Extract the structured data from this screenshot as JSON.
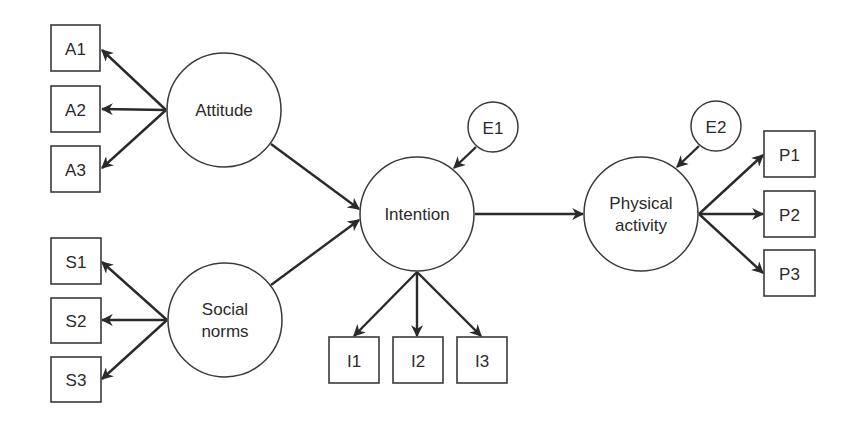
{
  "diagram": {
    "type": "structural-equation-model",
    "colors": {
      "stroke": "#2a2a2a",
      "fill": "#ffffff",
      "text": "#2a2a2a"
    },
    "latent_nodes": [
      {
        "id": "attitude",
        "label_lines": [
          "Attitude"
        ],
        "cx": 224,
        "cy": 110,
        "r": 57
      },
      {
        "id": "social_norms",
        "label_lines": [
          "Social",
          "norms"
        ],
        "cx": 225,
        "cy": 320,
        "r": 57
      },
      {
        "id": "intention",
        "label_lines": [
          "Intention"
        ],
        "cx": 417,
        "cy": 214,
        "r": 57
      },
      {
        "id": "physical_activity",
        "label_lines": [
          "Physical",
          "activity"
        ],
        "cx": 641,
        "cy": 214,
        "r": 57
      }
    ],
    "error_nodes": [
      {
        "id": "e1",
        "label": "E1",
        "cx": 493,
        "cy": 127,
        "r": 25
      },
      {
        "id": "e2",
        "label": "E2",
        "cx": 716,
        "cy": 126,
        "r": 25
      }
    ],
    "indicator_nodes": [
      {
        "id": "a1",
        "label": "A1",
        "x": 51,
        "y": 25,
        "w": 49,
        "h": 46
      },
      {
        "id": "a2",
        "label": "A2",
        "x": 51,
        "y": 86,
        "w": 49,
        "h": 46
      },
      {
        "id": "a3",
        "label": "A3",
        "x": 51,
        "y": 146,
        "w": 49,
        "h": 46
      },
      {
        "id": "s1",
        "label": "S1",
        "x": 51,
        "y": 238,
        "w": 50,
        "h": 46
      },
      {
        "id": "s2",
        "label": "S2",
        "x": 51,
        "y": 298,
        "w": 50,
        "h": 45
      },
      {
        "id": "s3",
        "label": "S3",
        "x": 51,
        "y": 357,
        "w": 50,
        "h": 45
      },
      {
        "id": "i1",
        "label": "I1",
        "x": 329,
        "y": 337,
        "w": 50,
        "h": 46
      },
      {
        "id": "i2",
        "label": "I2",
        "x": 393,
        "y": 337,
        "w": 50,
        "h": 46
      },
      {
        "id": "i3",
        "label": "I3",
        "x": 457,
        "y": 337,
        "w": 50,
        "h": 46
      },
      {
        "id": "p1",
        "label": "P1",
        "x": 764,
        "y": 131,
        "w": 51,
        "h": 46
      },
      {
        "id": "p2",
        "label": "P2",
        "x": 764,
        "y": 191,
        "w": 51,
        "h": 46
      },
      {
        "id": "p3",
        "label": "P3",
        "x": 764,
        "y": 250,
        "w": 51,
        "h": 46
      }
    ],
    "edges": [
      {
        "from": "attitude",
        "to": "a1",
        "x1": 166,
        "y1": 110,
        "x2": 102,
        "y2": 50
      },
      {
        "from": "attitude",
        "to": "a2",
        "x1": 166,
        "y1": 110,
        "x2": 102,
        "y2": 109
      },
      {
        "from": "attitude",
        "to": "a3",
        "x1": 166,
        "y1": 110,
        "x2": 102,
        "y2": 168
      },
      {
        "from": "social_norms",
        "to": "s1",
        "x1": 167,
        "y1": 320,
        "x2": 102,
        "y2": 262
      },
      {
        "from": "social_norms",
        "to": "s2",
        "x1": 167,
        "y1": 320,
        "x2": 102,
        "y2": 320
      },
      {
        "from": "social_norms",
        "to": "s3",
        "x1": 167,
        "y1": 320,
        "x2": 102,
        "y2": 379
      },
      {
        "from": "attitude",
        "to": "intention",
        "x1": 271,
        "y1": 144,
        "x2": 359,
        "y2": 209
      },
      {
        "from": "social_norms",
        "to": "intention",
        "x1": 271,
        "y1": 285,
        "x2": 359,
        "y2": 220
      },
      {
        "from": "e1",
        "to": "intention",
        "x1": 476,
        "y1": 147,
        "x2": 454,
        "y2": 168
      },
      {
        "from": "intention",
        "to": "i1",
        "x1": 417,
        "y1": 272,
        "x2": 354,
        "y2": 336
      },
      {
        "from": "intention",
        "to": "i2",
        "x1": 417,
        "y1": 272,
        "x2": 417,
        "y2": 336
      },
      {
        "from": "intention",
        "to": "i3",
        "x1": 417,
        "y1": 272,
        "x2": 481,
        "y2": 336
      },
      {
        "from": "intention",
        "to": "physical_activity",
        "x1": 475,
        "y1": 214,
        "x2": 583,
        "y2": 214
      },
      {
        "from": "e2",
        "to": "physical_activity",
        "x1": 699,
        "y1": 146,
        "x2": 677,
        "y2": 167
      },
      {
        "from": "physical_activity",
        "to": "p1",
        "x1": 699,
        "y1": 214,
        "x2": 763,
        "y2": 155
      },
      {
        "from": "physical_activity",
        "to": "p2",
        "x1": 699,
        "y1": 214,
        "x2": 763,
        "y2": 214
      },
      {
        "from": "physical_activity",
        "to": "p3",
        "x1": 699,
        "y1": 214,
        "x2": 763,
        "y2": 273
      }
    ]
  }
}
